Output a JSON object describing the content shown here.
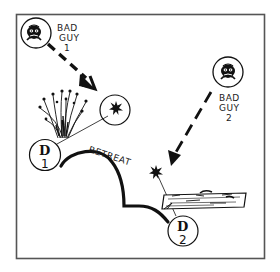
{
  "diagram": {
    "type": "tactical-sketch",
    "frame": {
      "stroke": "#555555"
    },
    "ink_color": "#111111",
    "enemies": [
      {
        "id": "bad-guy-1",
        "label_line1": "BAD",
        "label_line2": "GUY",
        "label_line3": "1",
        "icon": "bandit-face-icon"
      },
      {
        "id": "bad-guy-2",
        "label_line1": "BAD",
        "label_line2": "GUY",
        "label_line3": "2",
        "icon": "bandit-face-icon"
      }
    ],
    "defenders": [
      {
        "id": "defender-1",
        "letter": "D",
        "number": "1",
        "cover": "tall-grass"
      },
      {
        "id": "defender-2",
        "letter": "D",
        "number": "2",
        "cover": "fallen-log"
      }
    ],
    "path": {
      "label": "RETREAT"
    },
    "markers": [
      {
        "id": "impact-star-1",
        "icon": "splat-star-icon"
      },
      {
        "id": "impact-star-2",
        "icon": "splat-star-icon"
      }
    ]
  }
}
